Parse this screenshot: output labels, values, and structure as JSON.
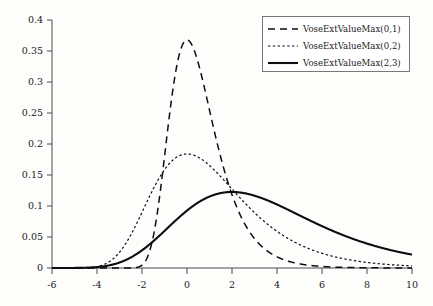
{
  "chart_data": {
    "type": "line",
    "title": "",
    "subtitle": "",
    "xlabel": "",
    "ylabel": "",
    "xlim": [
      -6,
      10
    ],
    "ylim": [
      0,
      0.4
    ],
    "grid": false,
    "legend_position": "top-right",
    "x_ticks": [
      "-6",
      "-4",
      "-2",
      "0",
      "2",
      "4",
      "6",
      "8",
      "10"
    ],
    "x_tick_values": [
      -6,
      -4,
      -2,
      0,
      2,
      4,
      6,
      8,
      10
    ],
    "y_ticks": [
      "0",
      "0.05",
      "0.1",
      "0.15",
      "0.2",
      "0.25",
      "0.3",
      "0.35",
      "0.4"
    ],
    "y_tick_values": [
      0,
      0.05,
      0.1,
      0.15,
      0.2,
      0.25,
      0.3,
      0.35,
      0.4
    ],
    "series": [
      {
        "name": "VoseExtValueMax(0,1)",
        "style": "dashed",
        "location": 0,
        "scale": 1,
        "peak_x": 0,
        "peak_y": 0.3679,
        "x": [
          -6,
          -5,
          -4,
          -3.5,
          -3,
          -2.5,
          -2,
          -1.5,
          -1,
          -0.5,
          0,
          0.5,
          1,
          1.5,
          2,
          2.5,
          3,
          3.5,
          4,
          4.5,
          5,
          5.5,
          6,
          7,
          8,
          9,
          10
        ],
        "values": [
          0,
          0,
          0,
          0,
          0,
          0.0001,
          0.0018,
          0.0137,
          0.0545,
          0.1334,
          0.2546,
          0.3679,
          0.3679,
          0.2547,
          0.1182,
          0.0464,
          0.0177,
          0.0067,
          0.0025,
          0.0009,
          0.0003,
          0.0001,
          0.0001,
          0,
          0,
          0,
          0
        ]
      },
      {
        "name": "VoseExtValueMax(0,2)",
        "style": "dotted",
        "location": 0,
        "scale": 2,
        "peak_x": 0,
        "peak_y": 0.1839,
        "x": [
          -6,
          -5,
          -4,
          -3.5,
          -3,
          -2.5,
          -2,
          -1.5,
          -1,
          -0.5,
          0,
          0.5,
          1,
          1.5,
          2,
          2.5,
          3,
          3.5,
          4,
          4.5,
          5,
          5.5,
          6,
          7,
          8,
          9,
          10
        ],
        "values": [
          0,
          0.0001,
          0.0009,
          0.0029,
          0.008,
          0.019,
          0.0385,
          0.0673,
          0.1032,
          0.1402,
          0.1709,
          0.1875,
          0.1839,
          0.1682,
          0.1455,
          0.1205,
          0.0964,
          0.0751,
          0.0572,
          0.0428,
          0.0316,
          0.0231,
          0.0167,
          0.0086,
          0.0044,
          0.0022,
          0.0011
        ]
      },
      {
        "name": "VoseExtValueMax(2,3)",
        "style": "solid",
        "location": 2,
        "scale": 3,
        "peak_x": 2,
        "peak_y": 0.1226,
        "x": [
          -6,
          -5,
          -4,
          -3.5,
          -3,
          -2.5,
          -2,
          -1.5,
          -1,
          -0.5,
          0,
          0.5,
          1,
          1.5,
          2,
          2.5,
          3,
          3.5,
          4,
          4.5,
          5,
          5.5,
          6,
          7,
          8,
          9,
          10
        ],
        "values": [
          0,
          0,
          0.0001,
          0.0004,
          0.0012,
          0.0032,
          0.0073,
          0.0144,
          0.0252,
          0.0391,
          0.0548,
          0.0703,
          0.0841,
          0.0949,
          0.1022,
          0.1063,
          0.1077,
          0.107,
          0.1049,
          0.1018,
          0.098,
          0.0937,
          0.0892,
          0.0797,
          0.0702,
          0.0614,
          0.0533
        ]
      }
    ],
    "legend_entries": [
      {
        "label": "VoseExtValueMax(0,1)",
        "style": "dashed"
      },
      {
        "label": "VoseExtValueMax(0,2)",
        "style": "dotted"
      },
      {
        "label": "VoseExtValueMax(2,3)",
        "style": "solid"
      }
    ]
  },
  "colors": {
    "curve": "#0d0d0d",
    "axis": "#4a4a4a",
    "text": "#1a1a1a",
    "background": "#fdfdfc",
    "legend_border": "#6b6b6b"
  }
}
